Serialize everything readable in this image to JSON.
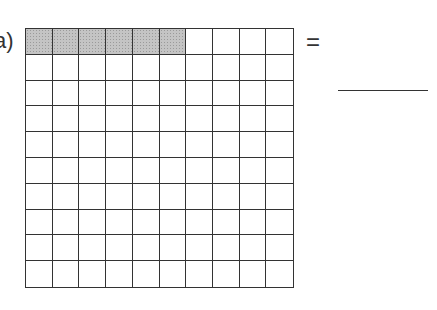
{
  "problem": {
    "label": "a)",
    "grid": {
      "rows": 10,
      "cols": 10,
      "total_cells": 100,
      "shaded_cells": 6,
      "shaded_row": 1,
      "shade_color": "#c4c4c4"
    },
    "equals_sign": "=",
    "answer_blank": ""
  }
}
